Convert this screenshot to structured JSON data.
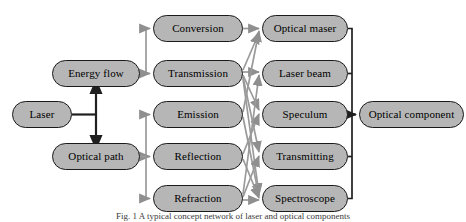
{
  "diagram": {
    "colors": {
      "node_fill": "#b6b6b6",
      "node_stroke": "#1a1a1a",
      "edge_gray": "#9a9a9a",
      "edge_dark": "#2b2b2b",
      "background": "#ffffff"
    },
    "columns": [
      {
        "name": "source-column",
        "nodes": [
          {
            "id": "laser",
            "label": "Laser"
          }
        ]
      },
      {
        "name": "pathway-column",
        "nodes": [
          {
            "id": "energy-flow",
            "label": "Energy flow"
          },
          {
            "id": "optical-path",
            "label": "Optical path"
          }
        ]
      },
      {
        "name": "process-column",
        "nodes": [
          {
            "id": "conversion",
            "label": "Conversion"
          },
          {
            "id": "transmission",
            "label": "Transmission"
          },
          {
            "id": "emission",
            "label": "Emission"
          },
          {
            "id": "reflection",
            "label": "Reflection"
          },
          {
            "id": "refraction",
            "label": "Refraction"
          }
        ]
      },
      {
        "name": "device-column",
        "nodes": [
          {
            "id": "optical-maser",
            "label": "Optical maser"
          },
          {
            "id": "laser-beam",
            "label": "Laser beam"
          },
          {
            "id": "speculum",
            "label": "Speculum"
          },
          {
            "id": "transmitting",
            "label": "Transmitting"
          },
          {
            "id": "spectroscope",
            "label": "Spectroscope"
          }
        ]
      },
      {
        "name": "result-column",
        "nodes": [
          {
            "id": "optical-component",
            "label": "Optical component"
          }
        ]
      }
    ],
    "edges": [
      {
        "from": "laser",
        "to": "energy-flow",
        "style": "dark-bidirectional"
      },
      {
        "from": "laser",
        "to": "optical-path",
        "style": "dark-bidirectional"
      },
      {
        "from": "energy-flow",
        "to": "conversion",
        "style": "gray-arrow"
      },
      {
        "from": "energy-flow",
        "to": "transmission",
        "style": "gray-arrow"
      },
      {
        "from": "optical-path",
        "to": "emission",
        "style": "gray-arrow"
      },
      {
        "from": "optical-path",
        "to": "reflection",
        "style": "gray-arrow"
      },
      {
        "from": "optical-path",
        "to": "refraction",
        "style": "gray-arrow"
      },
      {
        "from": "conversion",
        "to": "optical-maser",
        "style": "gray-arrow"
      },
      {
        "from": "transmission",
        "to": "optical-maser",
        "style": "gray-arrow"
      },
      {
        "from": "transmission",
        "to": "laser-beam",
        "style": "gray-arrow"
      },
      {
        "from": "transmission",
        "to": "speculum",
        "style": "gray-arrow"
      },
      {
        "from": "transmission",
        "to": "transmitting",
        "style": "gray-arrow"
      },
      {
        "from": "transmission",
        "to": "spectroscope",
        "style": "gray-arrow"
      },
      {
        "from": "emission",
        "to": "optical-maser",
        "style": "gray-arrow"
      },
      {
        "from": "emission",
        "to": "spectroscope",
        "style": "gray-arrow"
      },
      {
        "from": "reflection",
        "to": "speculum",
        "style": "gray-arrow"
      },
      {
        "from": "reflection",
        "to": "spectroscope",
        "style": "gray-arrow"
      },
      {
        "from": "refraction",
        "to": "laser-beam",
        "style": "gray-arrow"
      },
      {
        "from": "refraction",
        "to": "transmitting",
        "style": "gray-arrow"
      },
      {
        "from": "refraction",
        "to": "spectroscope",
        "style": "gray-arrow"
      },
      {
        "from": "optical-maser",
        "to": "optical-component",
        "style": "dark-bus"
      },
      {
        "from": "laser-beam",
        "to": "optical-component",
        "style": "dark-bus"
      },
      {
        "from": "speculum",
        "to": "optical-component",
        "style": "dark-bus"
      },
      {
        "from": "transmitting",
        "to": "optical-component",
        "style": "dark-bus"
      },
      {
        "from": "spectroscope",
        "to": "optical-component",
        "style": "dark-bus"
      }
    ],
    "caption": "Fig. 1  A typical concept network of laser and optical components"
  }
}
